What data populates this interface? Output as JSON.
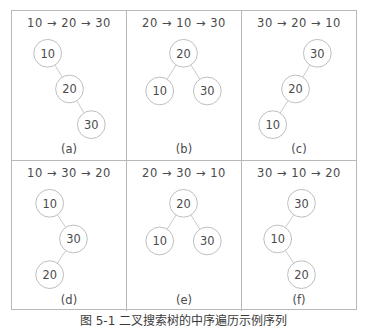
{
  "figure": {
    "caption": "图 5-1   二叉搜索树的中序遍历示例序列",
    "arrow_glyph": "→",
    "node_stroke_color": "#bdbdbd",
    "edge_color": "#c9c9c9",
    "border_color": "#b8b8b8",
    "text_color": "#4a4a4a"
  },
  "panels": [
    {
      "label": "(a)",
      "sequence": "10 → 20 → 30",
      "insert_order": [
        10,
        20,
        30
      ],
      "shape": "right-chain",
      "nodes": [
        {
          "value": "10",
          "cx": 36,
          "cy": 20
        },
        {
          "value": "20",
          "cx": 58,
          "cy": 56
        },
        {
          "value": "30",
          "cx": 80,
          "cy": 92
        }
      ],
      "edges": [
        {
          "from": 0,
          "to": 1
        },
        {
          "from": 1,
          "to": 2
        }
      ]
    },
    {
      "label": "(b)",
      "sequence": "20 → 10 → 30",
      "insert_order": [
        20,
        10,
        30
      ],
      "shape": "balanced",
      "nodes": [
        {
          "value": "20",
          "cx": 57,
          "cy": 20
        },
        {
          "value": "10",
          "cx": 33,
          "cy": 58
        },
        {
          "value": "30",
          "cx": 81,
          "cy": 58
        }
      ],
      "edges": [
        {
          "from": 0,
          "to": 1
        },
        {
          "from": 0,
          "to": 2
        }
      ]
    },
    {
      "label": "(c)",
      "sequence": "30 → 20 → 10",
      "insert_order": [
        30,
        20,
        10
      ],
      "shape": "left-chain",
      "nodes": [
        {
          "value": "30",
          "cx": 76,
          "cy": 20
        },
        {
          "value": "20",
          "cx": 54,
          "cy": 56
        },
        {
          "value": "10",
          "cx": 31,
          "cy": 92
        }
      ],
      "edges": [
        {
          "from": 0,
          "to": 1
        },
        {
          "from": 1,
          "to": 2
        }
      ]
    },
    {
      "label": "(d)",
      "sequence": "10 → 30 → 20",
      "insert_order": [
        10,
        30,
        20
      ],
      "shape": "zigzag-right-left",
      "nodes": [
        {
          "value": "10",
          "cx": 38,
          "cy": 20
        },
        {
          "value": "30",
          "cx": 62,
          "cy": 56
        },
        {
          "value": "20",
          "cx": 38,
          "cy": 92
        }
      ],
      "edges": [
        {
          "from": 0,
          "to": 1
        },
        {
          "from": 1,
          "to": 2
        }
      ]
    },
    {
      "label": "(e)",
      "sequence": "20 → 30 → 10",
      "insert_order": [
        20,
        30,
        10
      ],
      "shape": "balanced",
      "nodes": [
        {
          "value": "20",
          "cx": 57,
          "cy": 20
        },
        {
          "value": "10",
          "cx": 33,
          "cy": 58
        },
        {
          "value": "30",
          "cx": 81,
          "cy": 58
        }
      ],
      "edges": [
        {
          "from": 0,
          "to": 1
        },
        {
          "from": 0,
          "to": 2
        }
      ]
    },
    {
      "label": "(f)",
      "sequence": "30 → 10 → 20",
      "insert_order": [
        30,
        10,
        20
      ],
      "shape": "zigzag-left-right",
      "nodes": [
        {
          "value": "30",
          "cx": 60,
          "cy": 20
        },
        {
          "value": "10",
          "cx": 36,
          "cy": 56
        },
        {
          "value": "20",
          "cx": 60,
          "cy": 92
        }
      ],
      "edges": [
        {
          "from": 0,
          "to": 1
        },
        {
          "from": 1,
          "to": 2
        }
      ]
    }
  ]
}
